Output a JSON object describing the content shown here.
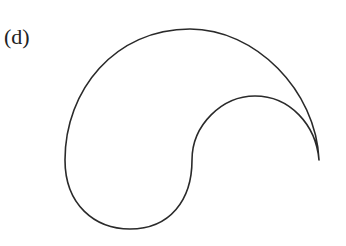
{
  "figure": {
    "label": "(d)",
    "stroke_color": "#2a2a2a",
    "background": "#ffffff"
  }
}
